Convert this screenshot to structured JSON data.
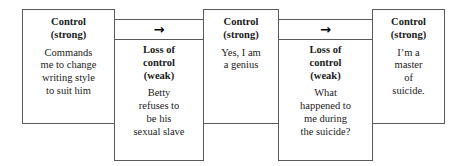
{
  "diagram": {
    "type": "flow-sequence",
    "orientation": "horizontal",
    "background_color": "#ffffff",
    "border_color": "#5a5a5a",
    "text_color": "#1a1a1a",
    "arrow_glyph": "→",
    "nodes": [
      {
        "id": "node-1",
        "kind": "control-strong",
        "title": "Control\n(strong)",
        "text": "Commands\nme to change\nwriting style\nto suit him",
        "has_arrow": false,
        "arrow": ""
      },
      {
        "id": "node-2",
        "kind": "loss-of-control-weak",
        "title": "Loss of\ncontrol\n(weak)",
        "text": "Betty\nrefuses to\nbe his\nsexual slave",
        "has_arrow": true,
        "arrow": "→"
      },
      {
        "id": "node-3",
        "kind": "control-strong",
        "title": "Control\n(strong)",
        "text": "Yes, I am\na genius",
        "has_arrow": false,
        "arrow": ""
      },
      {
        "id": "node-4",
        "kind": "loss-of-control-weak",
        "title": "Loss of\ncontrol\n(weak)",
        "text": "What\nhappened to\nme during\nthe suicide?",
        "has_arrow": true,
        "arrow": "→"
      },
      {
        "id": "node-5",
        "kind": "control-strong",
        "title": "Control\n(strong)",
        "text": "I’m a\nmaster\nof\nsuicide.",
        "has_arrow": false,
        "arrow": ""
      }
    ]
  }
}
